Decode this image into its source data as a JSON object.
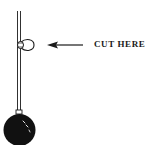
{
  "diagram": {
    "label": "CUT HERE",
    "elements": {
      "string": "vertical-string",
      "loop": "string-loop-knot",
      "arrow": "left-arrow",
      "weight": "ball-weight"
    },
    "colors": {
      "ink": "#1a1a1a",
      "background": "#ffffff"
    }
  }
}
